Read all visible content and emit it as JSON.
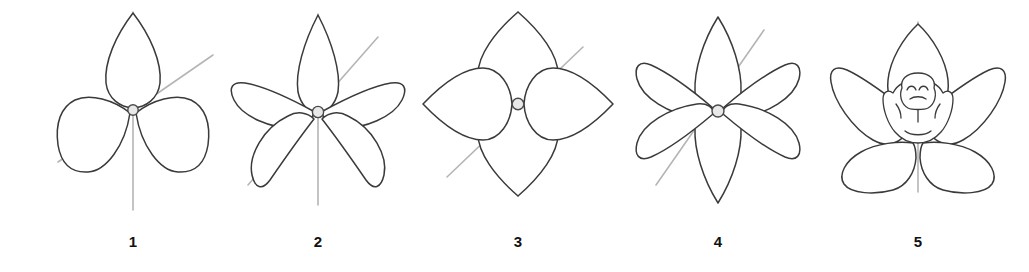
{
  "figure": {
    "title": "",
    "background_color": "#ffffff",
    "outline_color": "#3a3a3a",
    "axis_color": "#b5b5b5",
    "center_color": "#e8e8e8",
    "label_color": "#111111"
  },
  "panels": [
    {
      "label": "1",
      "name": "flower-three-petal",
      "petal_count": 3,
      "symmetry": "bilateral",
      "center_x": 133,
      "center_y": 118,
      "has_vertical_axis": true,
      "has_diagonal_axis": true,
      "diagonal_angle_deg": 35
    },
    {
      "label": "2",
      "name": "flower-five-petal",
      "petal_count": 5,
      "symmetry": "radial",
      "center_x": 318,
      "center_y": 118,
      "has_vertical_axis": true,
      "has_diagonal_axis": true,
      "diagonal_angle_deg": 45
    },
    {
      "label": "3",
      "name": "flower-four-petal",
      "petal_count": 4,
      "symmetry": "radial",
      "center_x": 518,
      "center_y": 110,
      "has_vertical_axis": true,
      "has_diagonal_axis": true,
      "diagonal_angle_deg": 45
    },
    {
      "label": "4",
      "name": "flower-six-petal",
      "petal_count": 6,
      "symmetry": "radial",
      "center_x": 718,
      "center_y": 118,
      "has_vertical_axis": true,
      "has_diagonal_axis": true,
      "diagonal_angle_deg": 45
    },
    {
      "label": "5",
      "name": "flower-orchid",
      "petal_count": 5,
      "symmetry": "bilateral",
      "center_x": 918,
      "center_y": 118,
      "has_vertical_axis": true,
      "has_diagonal_axis": false,
      "diagonal_angle_deg": 0
    }
  ]
}
